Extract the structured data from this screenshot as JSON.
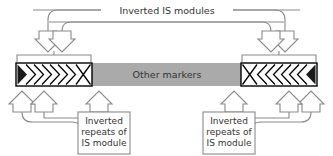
{
  "diagram": {
    "title_label": "Inverted IS modules",
    "center_bar_label": "Other markers",
    "bottom_left_label": {
      "line1": "Inverted",
      "line2": "repeats of",
      "line3": "IS module"
    },
    "bottom_right_label": {
      "line1": "Inverted",
      "line2": "repeats of",
      "line3": "IS module"
    },
    "colors": {
      "stroke": "#8a8a8a",
      "text": "#333333",
      "bar_fill": "#aaaaaa",
      "module_fill": "#ffffff",
      "module_stroke": "#000000",
      "terminal_fill": "#1a1a1a",
      "background": "#ffffff",
      "box_fill": "#ffffff"
    },
    "left_module": {
      "name": "IS module left",
      "terminal_side": "left",
      "chevron_count": 6,
      "chevron_direction": "right",
      "has_x_marker": true,
      "x_marker_side": "right"
    },
    "right_module": {
      "name": "IS module right",
      "terminal_side": "right",
      "chevron_count": 6,
      "chevron_direction": "left",
      "has_x_marker": true,
      "x_marker_side": "left"
    },
    "arrows": {
      "top_count": 4,
      "top_direction": "down",
      "bottom_count": 6,
      "bottom_direction": "up"
    }
  }
}
